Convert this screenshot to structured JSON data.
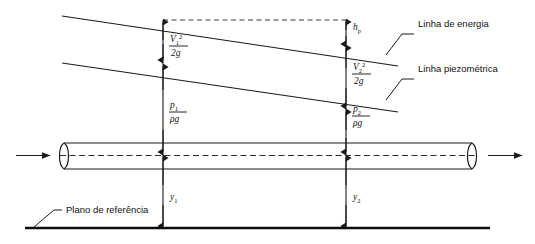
{
  "figure": {
    "background_color": "#ffffff",
    "line_color": "#1a1a1a"
  },
  "annotations": {
    "energy_line_label": "Linha de energia",
    "piezometric_line_label": "Linha piezométrica",
    "datum_label": "Plano de referência"
  },
  "stations": {
    "station1": {
      "velocity_head_numerator": "V",
      "velocity_head_num_sub": "1",
      "velocity_head_num_sup": "2",
      "velocity_head_denominator": "2g",
      "pressure_head_numerator": "p",
      "pressure_head_num_sub": "1",
      "pressure_head_denominator": "ρg",
      "elevation_label": "y",
      "elevation_sub": "1"
    },
    "station2": {
      "velocity_head_numerator": "V",
      "velocity_head_num_sub": "2",
      "velocity_head_num_sup": "2",
      "velocity_head_denominator": "2g",
      "pressure_head_numerator": "p",
      "pressure_head_num_sub": "2",
      "pressure_head_denominator": "ρg",
      "elevation_label": "y",
      "elevation_sub": "2"
    }
  },
  "head_loss": {
    "label": "h",
    "sub": "p"
  },
  "flow": {
    "inlet_arrow": "flow-arrow-right",
    "outlet_arrow": "flow-arrow-right"
  }
}
